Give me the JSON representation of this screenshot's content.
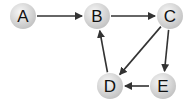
{
  "graph": {
    "type": "directed",
    "nodes": [
      {
        "id": "A",
        "label": "A",
        "x": 23,
        "y": 16
      },
      {
        "id": "B",
        "label": "B",
        "x": 97,
        "y": 16
      },
      {
        "id": "C",
        "label": "C",
        "x": 170,
        "y": 16
      },
      {
        "id": "D",
        "label": "D",
        "x": 110,
        "y": 86
      },
      {
        "id": "E",
        "label": "E",
        "x": 163,
        "y": 86
      }
    ],
    "edges": [
      {
        "from": "A",
        "to": "B"
      },
      {
        "from": "B",
        "to": "C"
      },
      {
        "from": "C",
        "to": "D"
      },
      {
        "from": "C",
        "to": "E"
      },
      {
        "from": "E",
        "to": "D"
      },
      {
        "from": "D",
        "to": "B"
      }
    ],
    "colors": {
      "node_fill_center": "#f2f2f2",
      "node_fill_edge": "#c8c8c8",
      "edge": "#333333",
      "label": "#111111"
    }
  }
}
